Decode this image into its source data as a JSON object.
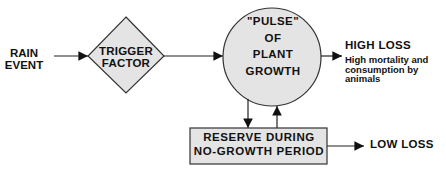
{
  "diagram": {
    "input": {
      "label_line1": "RAIN",
      "label_line2": "EVENT"
    },
    "trigger": {
      "label_line1": "TRIGGER",
      "label_line2": "FACTOR",
      "shape": "diamond"
    },
    "pulse": {
      "line1": "\"PULSE\"",
      "line2": "OF",
      "line3": "PLANT",
      "line4": "GROWTH",
      "shape": "circle"
    },
    "reserve": {
      "line1": "RESERVE DURING",
      "line2": "NO-GROWTH PERIOD",
      "shape": "rectangle"
    },
    "high_loss": {
      "title": "HIGH LOSS",
      "desc_line1": "High mortality and",
      "desc_line2": "consumption by",
      "desc_line3": "animals"
    },
    "low_loss": {
      "title": "LOW LOSS"
    }
  },
  "colors": {
    "fill": "#e4e4e4",
    "stroke": "#333333",
    "text": "#111111"
  }
}
